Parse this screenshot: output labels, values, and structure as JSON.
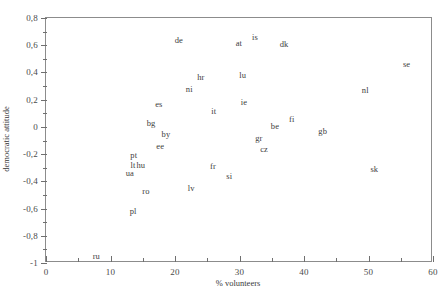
{
  "chart_data": {
    "type": "scatter",
    "title": "",
    "xlabel": "% volunteers",
    "ylabel": "democratic attitude",
    "xlim": [
      0,
      60
    ],
    "ylim": [
      -1,
      0.8
    ],
    "grid": false,
    "legend": null,
    "point_marker": "text-label",
    "decimal_separator": ",",
    "xticks": [
      {
        "value": 0,
        "label": "0"
      },
      {
        "value": 5,
        "label": ""
      },
      {
        "value": 10,
        "label": "10"
      },
      {
        "value": 15,
        "label": ""
      },
      {
        "value": 20,
        "label": "20"
      },
      {
        "value": 25,
        "label": ""
      },
      {
        "value": 30,
        "label": "30"
      },
      {
        "value": 35,
        "label": ""
      },
      {
        "value": 40,
        "label": "40"
      },
      {
        "value": 45,
        "label": ""
      },
      {
        "value": 50,
        "label": "50"
      },
      {
        "value": 55,
        "label": ""
      },
      {
        "value": 60,
        "label": "60"
      }
    ],
    "yticks": [
      {
        "value": 0.8,
        "label": "0,8"
      },
      {
        "value": 0.7,
        "label": ""
      },
      {
        "value": 0.6,
        "label": "0,6"
      },
      {
        "value": 0.5,
        "label": ""
      },
      {
        "value": 0.4,
        "label": "0,4"
      },
      {
        "value": 0.3,
        "label": ""
      },
      {
        "value": 0.2,
        "label": "0,2"
      },
      {
        "value": 0.1,
        "label": ""
      },
      {
        "value": 0.0,
        "label": "0"
      },
      {
        "value": -0.1,
        "label": ""
      },
      {
        "value": -0.2,
        "label": "-0,2"
      },
      {
        "value": -0.3,
        "label": ""
      },
      {
        "value": -0.4,
        "label": "-0,4"
      },
      {
        "value": -0.5,
        "label": ""
      },
      {
        "value": -0.6,
        "label": "-0,6"
      },
      {
        "value": -0.7,
        "label": ""
      },
      {
        "value": -0.8,
        "label": "-0,8"
      },
      {
        "value": -0.9,
        "label": ""
      },
      {
        "value": -1.0,
        "label": "-1"
      }
    ],
    "points": [
      {
        "label": "de",
        "x": 20.6,
        "y": 0.64
      },
      {
        "label": "is",
        "x": 32.4,
        "y": 0.66
      },
      {
        "label": "at",
        "x": 29.9,
        "y": 0.62
      },
      {
        "label": "dk",
        "x": 36.9,
        "y": 0.61
      },
      {
        "label": "se",
        "x": 55.9,
        "y": 0.46
      },
      {
        "label": "hr",
        "x": 24.0,
        "y": 0.37
      },
      {
        "label": "lu",
        "x": 30.5,
        "y": 0.38
      },
      {
        "label": "ni",
        "x": 22.2,
        "y": 0.28
      },
      {
        "label": "nl",
        "x": 49.5,
        "y": 0.27
      },
      {
        "label": "es",
        "x": 17.5,
        "y": 0.17
      },
      {
        "label": "ie",
        "x": 30.7,
        "y": 0.18
      },
      {
        "label": "it",
        "x": 26.0,
        "y": 0.12
      },
      {
        "label": "fi",
        "x": 38.1,
        "y": 0.06
      },
      {
        "label": "bg",
        "x": 16.3,
        "y": 0.03
      },
      {
        "label": "be",
        "x": 35.5,
        "y": 0.01
      },
      {
        "label": "gb",
        "x": 42.9,
        "y": -0.03
      },
      {
        "label": "by",
        "x": 18.6,
        "y": -0.05
      },
      {
        "label": "gr",
        "x": 33.0,
        "y": -0.08
      },
      {
        "label": "ee",
        "x": 17.7,
        "y": -0.14
      },
      {
        "label": "cz",
        "x": 33.8,
        "y": -0.16
      },
      {
        "label": "pt",
        "x": 13.6,
        "y": -0.21
      },
      {
        "label": "lt",
        "x": 13.5,
        "y": -0.28
      },
      {
        "label": "hu",
        "x": 14.7,
        "y": -0.28
      },
      {
        "label": "fr",
        "x": 25.9,
        "y": -0.29
      },
      {
        "label": "ua",
        "x": 13.0,
        "y": -0.34
      },
      {
        "label": "si",
        "x": 28.4,
        "y": -0.36
      },
      {
        "label": "sk",
        "x": 50.9,
        "y": -0.31
      },
      {
        "label": "lv",
        "x": 22.5,
        "y": -0.45
      },
      {
        "label": "ro",
        "x": 15.5,
        "y": -0.47
      },
      {
        "label": "pl",
        "x": 13.5,
        "y": -0.62
      },
      {
        "label": "ru",
        "x": 7.8,
        "y": -0.95
      }
    ]
  }
}
